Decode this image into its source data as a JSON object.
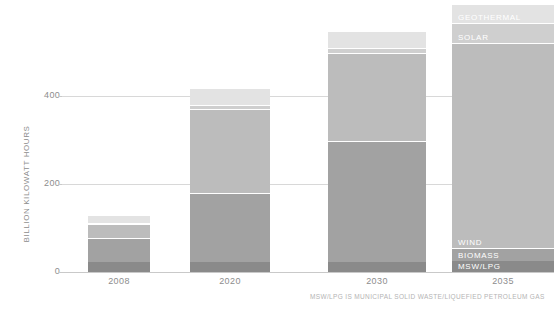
{
  "chart_data": {
    "type": "bar",
    "stacked": true,
    "title": "",
    "xlabel": "",
    "ylabel": "BILLION KILOWATT HOURS",
    "categories": [
      "2008",
      "2020",
      "2030",
      "2035"
    ],
    "ylim": [
      0,
      640
    ],
    "yticks": [
      0,
      200,
      400
    ],
    "ytick_labels": [
      "0",
      "200",
      "400"
    ],
    "grid": true,
    "legend": "inline-labels-on-last-bar",
    "series": [
      {
        "name": "MSW/LPG",
        "values": [
          22,
          22,
          22,
          25
        ],
        "color": "#8a8a8a"
      },
      {
        "name": "BIOMASS",
        "values": [
          55,
          158,
          275,
          30
        ],
        "color": "#a2a2a2"
      },
      {
        "name": "WIND",
        "values": [
          32,
          190,
          200,
          465
        ],
        "color": "#bcbcbc"
      },
      {
        "name": "SOLAR",
        "values": [
          3,
          10,
          12,
          45
        ],
        "color": "#cfcfcf"
      },
      {
        "name": "GEOTHERMAL",
        "values": [
          17,
          38,
          38,
          45
        ],
        "color": "#e3e3e3"
      }
    ],
    "totals": [
      129,
      418,
      547,
      610
    ],
    "annotations": [
      {
        "text": "GEOTHERMAL",
        "series": "GEOTHERMAL",
        "category": "2035"
      },
      {
        "text": "SOLAR",
        "series": "SOLAR",
        "category": "2035"
      },
      {
        "text": "WIND",
        "series": "WIND",
        "category": "2035"
      },
      {
        "text": "BIOMASS",
        "series": "BIOMASS",
        "category": "2035"
      },
      {
        "text": "MSW/LPG",
        "series": "MSW/LPG",
        "category": "2035"
      }
    ]
  },
  "footnote": "MSW/LPG IS MUNICIPAL SOLID WASTE/LIQUEFIED PETROLEUM GAS",
  "colors": {
    "gridline": "#d8d8d8",
    "text_muted": "#8d8d8d",
    "footnote": "#b4b4b4",
    "background": "#ffffff"
  }
}
